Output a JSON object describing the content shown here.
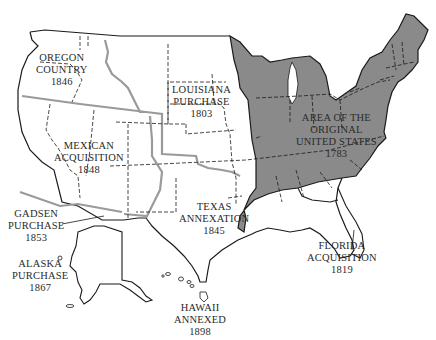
{
  "map": {
    "colors": {
      "original_states_fill": "#8a8a8a",
      "border": "#1a1a1a",
      "acquisition_boundary": "#9a9a9a",
      "background": "#ffffff"
    },
    "regions": [
      {
        "id": "oregon",
        "lines": [
          "OREGON",
          "COUNTRY",
          "1846"
        ]
      },
      {
        "id": "louisiana",
        "lines": [
          "LOUISIANA",
          "PURCHASE",
          "1803"
        ]
      },
      {
        "id": "original",
        "lines": [
          "AREA OF THE",
          "ORIGINAL",
          "UNITED STATES",
          "1783"
        ]
      },
      {
        "id": "mexican",
        "lines": [
          "MEXICAN",
          "ACQUISITION",
          "1848"
        ]
      },
      {
        "id": "texas",
        "lines": [
          "TEXAS",
          "ANNEXATION",
          "1845"
        ]
      },
      {
        "id": "gadsen",
        "lines": [
          "GADSEN",
          "PURCHASE",
          "1853"
        ]
      },
      {
        "id": "florida",
        "lines": [
          "FLORIDA",
          "ACQUISITION",
          "1819"
        ]
      },
      {
        "id": "alaska",
        "lines": [
          "ALASKA",
          "PURCHASE",
          "1867"
        ]
      },
      {
        "id": "hawaii",
        "lines": [
          "HAWAII",
          "ANNEXED",
          "1898"
        ]
      }
    ]
  }
}
